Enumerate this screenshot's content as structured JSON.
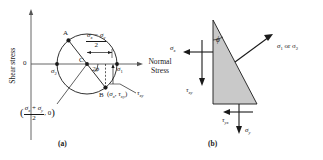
{
  "figure": {
    "panel_a": {
      "caption": "(a)",
      "axes": {
        "y_label": "Shear stress",
        "x_label_line1": "Normal",
        "x_label_line2": "Stress",
        "origin_label": "0"
      },
      "points": {
        "a": "A",
        "b": "B",
        "center": "C"
      },
      "labels": {
        "sigma1": "σ",
        "sigma1_sub": "1",
        "sigma2": "σ",
        "sigma2_sub": "2",
        "angle": "2ϕ",
        "tau_xy": "τ",
        "tau_xy_sub": "xy",
        "b_coords_open": "(",
        "b_coords_sigma": "σ",
        "b_coords_sigma_sub": "x",
        "b_coords_comma": ", ",
        "b_coords_tau": "τ",
        "b_coords_tau_sub": "xy",
        "b_coords_close": ")",
        "radius_num_s1": "σ",
        "radius_num_s1_sub": "x",
        "radius_num_minus": " − ",
        "radius_num_s2": "σ",
        "radius_num_s2_sub": "y",
        "radius_den": "2",
        "center_open": "(",
        "center_num_s1": "σ",
        "center_num_s1_sub": "x",
        "center_num_plus": " + ",
        "center_num_s2": "σ",
        "center_num_s2_sub": "y",
        "center_den": "2",
        "center_comma_zero": ", 0",
        "center_close": ")"
      }
    },
    "panel_b": {
      "caption": "(b)",
      "labels": {
        "principal": "σ",
        "principal_sub1": "1",
        "principal_or": " or σ",
        "principal_sub2": "2",
        "sigma_x": "σ",
        "sigma_x_sub": "x",
        "sigma_y": "σ",
        "sigma_y_sub": "y",
        "tau_xy": "τ",
        "tau_xy_sub": "xy",
        "tau_yx": "τ",
        "tau_yx_sub": "yx",
        "angle": "ϕ"
      }
    }
  },
  "colors": {
    "stroke": "#1a1a1a",
    "triangle_fill": "#c9c9c9",
    "axis": "#555555"
  }
}
